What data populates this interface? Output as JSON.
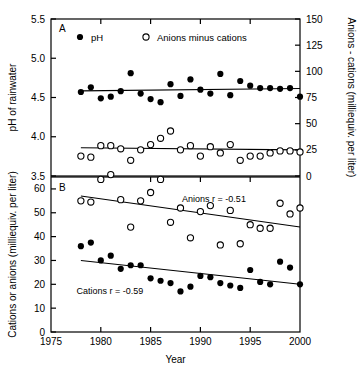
{
  "figure": {
    "panelA_label": "A",
    "panelB_label": "B",
    "xlabel": "Year"
  },
  "legend": {
    "items": [
      {
        "marker": "filled-circle",
        "label": "pH"
      },
      {
        "marker": "open-circle",
        "label": "Anions minus cations"
      }
    ]
  },
  "annotations": {
    "anions_r": "Anions r = -0.51",
    "cations_r": "Cations r = -0.59"
  },
  "colors": {
    "axis": "#000000",
    "marker_filled": "#000000",
    "marker_open": "#ffffff",
    "trend": "#000000",
    "background": "#ffffff"
  },
  "chart_data": [
    {
      "type": "scatter",
      "panel": "A",
      "title": "",
      "xlabel": "Year",
      "ylabel": "pH of rainwater",
      "y2label": "Anions - cations (milliequiv. per liter)",
      "xlim": [
        1975,
        2000
      ],
      "ylim": [
        3.5,
        5.5
      ],
      "y2lim": [
        0,
        150
      ],
      "xticks": [
        1975,
        1980,
        1985,
        1990,
        1995,
        2000
      ],
      "yticks": [
        3.5,
        4.0,
        4.5,
        5.0,
        5.5
      ],
      "y2ticks": [
        0,
        25,
        50,
        75,
        100,
        125,
        150
      ],
      "grid": false,
      "legend_position": "top-inside",
      "series": [
        {
          "name": "pH",
          "marker": "filled-circle",
          "axis": "left",
          "x": [
            1978,
            1979,
            1980,
            1981,
            1982,
            1983,
            1984,
            1985,
            1986,
            1987,
            1988,
            1989,
            1990,
            1991,
            1992,
            1993,
            1994,
            1995,
            1996,
            1997,
            1998,
            1999,
            2000
          ],
          "values": [
            4.57,
            4.63,
            4.49,
            4.51,
            4.58,
            4.81,
            4.55,
            4.48,
            4.44,
            4.67,
            4.52,
            4.73,
            4.6,
            4.55,
            4.8,
            4.53,
            4.71,
            4.65,
            4.62,
            4.62,
            4.61,
            4.62,
            4.51
          ],
          "trend": {
            "x": [
              1978,
              2000
            ],
            "y": [
              4.585,
              4.615
            ]
          }
        },
        {
          "name": "Anions minus cations",
          "marker": "open-circle",
          "axis": "right",
          "x": [
            1978,
            1979,
            1980,
            1981,
            1982,
            1983,
            1984,
            1985,
            1986,
            1987,
            1988,
            1989,
            1990,
            1991,
            1992,
            1993,
            1994,
            1995,
            1996,
            1997,
            1998,
            1999,
            2000
          ],
          "values": [
            19,
            18,
            29,
            29,
            26,
            15,
            25,
            30,
            36,
            43,
            25,
            29,
            19,
            28,
            22,
            30,
            15,
            19,
            19,
            22,
            24,
            24,
            23
          ],
          "trend": {
            "x": [
              1978,
              2000
            ],
            "y": [
              27.0,
              25.0
            ]
          }
        }
      ]
    },
    {
      "type": "scatter",
      "panel": "B",
      "title": "",
      "xlabel": "Year",
      "ylabel": "Cations or anions (milliequiv. per liter)",
      "xlim": [
        1975,
        2000
      ],
      "ylim": [
        0,
        65
      ],
      "xticks": [
        1975,
        1980,
        1985,
        1990,
        1995,
        2000
      ],
      "yticks": [
        0,
        10,
        20,
        30,
        40,
        50,
        60
      ],
      "grid": false,
      "series": [
        {
          "name": "Anions",
          "marker": "open-circle",
          "r": -0.51,
          "x": [
            1978,
            1979,
            1980,
            1981,
            1982,
            1983,
            1984,
            1985,
            1986,
            1987,
            1988,
            1989,
            1990,
            1991,
            1992,
            1993,
            1994,
            1995,
            1996,
            1997,
            1998,
            1999,
            2000
          ],
          "values": [
            55,
            54.5,
            64,
            66,
            55.5,
            44,
            55,
            58.5,
            64,
            46,
            52,
            39.5,
            50.5,
            53,
            36.5,
            51,
            37,
            45,
            43.5,
            43.5,
            54,
            49.5,
            52
          ],
          "trend": {
            "x": [
              1978,
              2000
            ],
            "y": [
              57.0,
              44.0
            ]
          }
        },
        {
          "name": "Cations",
          "marker": "filled-circle",
          "r": -0.59,
          "x": [
            1978,
            1979,
            1980,
            1981,
            1982,
            1983,
            1984,
            1985,
            1986,
            1987,
            1988,
            1989,
            1990,
            1991,
            1992,
            1993,
            1994,
            1995,
            1996,
            1997,
            1998,
            1999,
            2000
          ],
          "values": [
            36,
            37.5,
            30,
            32,
            26.5,
            28,
            28,
            22.5,
            21.5,
            20.5,
            17,
            19,
            23.5,
            23,
            20.5,
            19.5,
            18.5,
            26,
            21,
            20,
            29.5,
            27,
            20
          ],
          "trend": {
            "x": [
              1978,
              2000
            ],
            "y": [
              30.0,
              20.0
            ]
          }
        }
      ]
    }
  ]
}
